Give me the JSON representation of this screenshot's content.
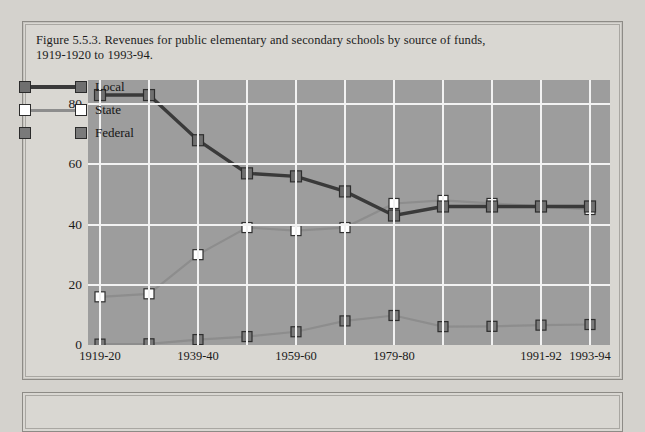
{
  "figure": {
    "caption_line1": "Figure 5.5.3. Revenues for public elementary and secondary schools by source of funds,",
    "caption_line2": "1919-1920 to 1993-94."
  },
  "colors": {
    "plot_background": "#9d9d9d",
    "gridline": "#f2f2f2",
    "local": "#3a3a3a",
    "state": "#ffffff",
    "federal": "#7a7a7a",
    "panel_background": "#d9d7d2"
  },
  "chart_data": {
    "type": "line",
    "title": "Figure 5.5.3. Revenues for public elementary and secondary schools by source of funds, 1919-1920 to 1993-94.",
    "xlabel": "",
    "ylabel": "",
    "grid": true,
    "legend_position": "inside-upper-left",
    "ylim": [
      0,
      88
    ],
    "yticks": [
      0,
      20,
      40,
      60,
      80
    ],
    "ytick_labels": [
      "0",
      "20",
      "40",
      "60",
      "80"
    ],
    "x": [
      "1919-20",
      "1929-30",
      "1939-40",
      "1949-50",
      "1959-60",
      "1969-70",
      "1979-80",
      "1985-86",
      "1989-90",
      "1991-92",
      "1993-94"
    ],
    "xtick_labels": [
      "1919-20",
      "1939-40",
      "1959-60",
      "1979-80",
      "1991-92",
      "1993-94"
    ],
    "xtick_indices": [
      0,
      2,
      4,
      6,
      9,
      10
    ],
    "series": [
      {
        "name": "Local",
        "color": "#3a3a3a",
        "marker": "square",
        "marker_fill": "#6f6f6f",
        "values": [
          83,
          83,
          68,
          57,
          56,
          51,
          43,
          46,
          46,
          46,
          46
        ]
      },
      {
        "name": "State",
        "color": "#8d8d8d",
        "marker": "square",
        "marker_fill": "#ffffff",
        "values": [
          16,
          17,
          30,
          39,
          38,
          39,
          47,
          48,
          47,
          46,
          45
        ]
      },
      {
        "name": "Federal",
        "color": "#8d8d8d",
        "marker": "square",
        "marker_fill": "#7a7a7a",
        "values": [
          0.3,
          0.4,
          1.8,
          2.8,
          4.4,
          8.0,
          9.8,
          6.1,
          6.2,
          6.6,
          6.8
        ]
      }
    ]
  },
  "legend": {
    "items": [
      {
        "label": "Local"
      },
      {
        "label": "State"
      },
      {
        "label": "Federal"
      }
    ]
  }
}
